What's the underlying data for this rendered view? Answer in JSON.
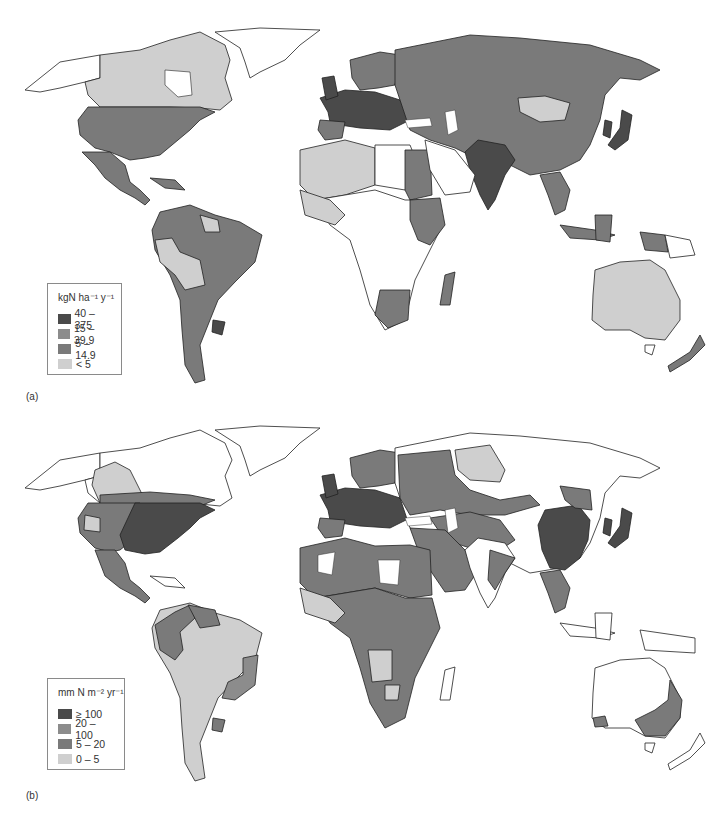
{
  "figure": {
    "panels": [
      {
        "label": "(a)",
        "legend": {
          "title_unit": "kgN",
          "title_rest": "ha",
          "title_exp1": "-1",
          "title_y": "y",
          "title_exp2": "-1",
          "title": "kgN ha⁻¹ y⁻¹",
          "items": [
            {
              "label": "40 – 375",
              "color": "#4a4a4a"
            },
            {
              "label": "15 – 39.9",
              "color": "#8c8c8c"
            },
            {
              "label": "5 – 14.9",
              "color": "#7a7a7a"
            },
            {
              "label": "< 5",
              "color": "#cfcfcf"
            }
          ]
        }
      },
      {
        "label": "(b)",
        "legend": {
          "title": "mm N m⁻² yr⁻¹",
          "items": [
            {
              "label": "≥ 100",
              "color": "#4a4a4a"
            },
            {
              "label": "20 – 100",
              "color": "#8c8c8c"
            },
            {
              "label": "5 – 20",
              "color": "#7a7a7a"
            },
            {
              "label": "0 – 5",
              "color": "#cfcfcf"
            }
          ]
        }
      }
    ]
  },
  "colors": {
    "very_high": "#4a4a4a",
    "high": "#8c8c8c",
    "medium": "#7a7a7a",
    "low": "#cfcfcf",
    "no_data": "#ffffff"
  }
}
